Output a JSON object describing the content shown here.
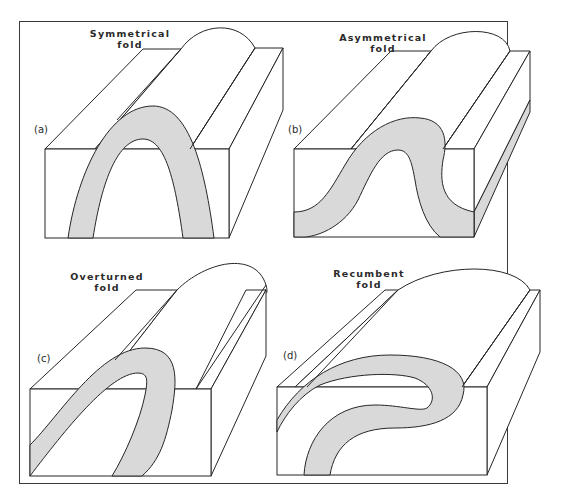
{
  "figure": {
    "fill_color": "#d9d9d9",
    "line_color": "#262626",
    "background": "#ffffff",
    "panels": [
      {
        "id": "a",
        "tag": "(a)",
        "title_line1": "Symmetrical",
        "title_line2": "fold"
      },
      {
        "id": "b",
        "tag": "(b)",
        "title_line1": "Asymmetrical",
        "title_line2": "fold"
      },
      {
        "id": "c",
        "tag": "(c)",
        "title_line1": "Overturned",
        "title_line2": "fold"
      },
      {
        "id": "d",
        "tag": "(d)",
        "title_line1": "Recumbent",
        "title_line2": "fold"
      }
    ]
  }
}
